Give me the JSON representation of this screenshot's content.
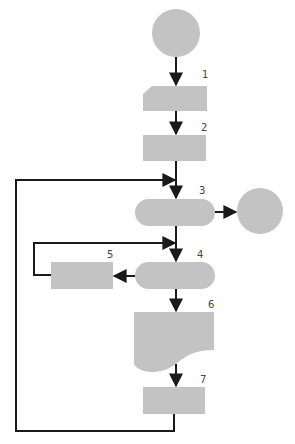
{
  "diagram": {
    "type": "flowchart",
    "colors": {
      "shape_fill": "#c3c3c3",
      "line": "#1a1a1a",
      "label": "#444444",
      "background": "#ffffff"
    },
    "nodes": [
      {
        "id": "start",
        "shape": "circle",
        "label": ""
      },
      {
        "id": "1",
        "shape": "manual-input",
        "label": "1"
      },
      {
        "id": "2",
        "shape": "process",
        "label": "2"
      },
      {
        "id": "3",
        "shape": "terminal",
        "label": "3"
      },
      {
        "id": "end",
        "shape": "circle",
        "label": ""
      },
      {
        "id": "4",
        "shape": "terminal",
        "label": "4"
      },
      {
        "id": "5",
        "shape": "process",
        "label": "5"
      },
      {
        "id": "6",
        "shape": "document",
        "label": "6"
      },
      {
        "id": "7",
        "shape": "process",
        "label": "7"
      }
    ],
    "edges": [
      {
        "from": "start",
        "to": "1"
      },
      {
        "from": "1",
        "to": "2"
      },
      {
        "from": "2",
        "to": "3"
      },
      {
        "from": "3",
        "to": "end"
      },
      {
        "from": "3",
        "to": "4"
      },
      {
        "from": "4",
        "to": "5"
      },
      {
        "from": "5",
        "to": "4",
        "note": "loop back above node 4"
      },
      {
        "from": "4",
        "to": "6"
      },
      {
        "from": "6",
        "to": "7"
      },
      {
        "from": "7",
        "to": "3",
        "note": "outer loop back above node 3"
      }
    ],
    "labels": {
      "n1": "1",
      "n2": "2",
      "n3": "3",
      "n4": "4",
      "n5": "5",
      "n6": "6",
      "n7": "7"
    }
  }
}
